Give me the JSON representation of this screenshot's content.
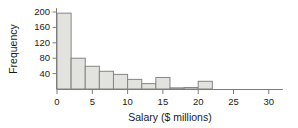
{
  "chart_data": {
    "type": "bar",
    "title": "",
    "subtitle": "",
    "xlabel": "Salary ($ millions)",
    "ylabel": "Frequency",
    "categories": [
      "0-2",
      "2-4",
      "4-6",
      "6-8",
      "8-10",
      "10-12",
      "12-14",
      "14-16",
      "16-18",
      "18-20",
      "20-22"
    ],
    "bin_starts": [
      0,
      2,
      4,
      6,
      8,
      10,
      12,
      14,
      16,
      18,
      20
    ],
    "bin_width": 2,
    "values": [
      197,
      80,
      59,
      46,
      38,
      25,
      14,
      30,
      3,
      4,
      20
    ],
    "xlim": [
      0,
      32
    ],
    "ylim": [
      0,
      210
    ],
    "xticks": [
      0,
      5,
      10,
      15,
      20,
      25,
      30
    ],
    "xtick_labels": [
      "0",
      "5",
      "10",
      "15",
      "20",
      "25",
      "30"
    ],
    "yticks": [
      40,
      80,
      120,
      160,
      200
    ],
    "ytick_labels": [
      "40",
      "80",
      "120",
      "160",
      "200"
    ],
    "grid": false,
    "legend": null,
    "legend_position": "none",
    "bar_fill_color": "#e2e2de",
    "bar_stroke_color": "#858585",
    "axis_color": "#7d7d7d",
    "text_color": "#1a1a1a",
    "background_color": "#ffffff"
  },
  "figure": {
    "width": 298,
    "height": 128
  }
}
